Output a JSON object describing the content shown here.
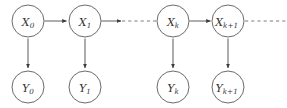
{
  "figure": {
    "title": "",
    "type": "directed-graphical-model",
    "background_color": "#ffffff",
    "node_stroke_color": "#5a5a5a",
    "edge_color": "#4a4a4a",
    "dashed_edge_color": "#6e6e6e",
    "label_color": "#333333"
  },
  "chart_data": {
    "type": "diagram",
    "title": "",
    "nodes": [
      {
        "id": "X0",
        "base": "X",
        "sub": "0",
        "label": "X0",
        "row": "hidden",
        "cx": 28,
        "cy": 21,
        "r": 16
      },
      {
        "id": "X1",
        "base": "X",
        "sub": "1",
        "label": "X1",
        "row": "hidden",
        "cx": 85,
        "cy": 21,
        "r": 16
      },
      {
        "id": "Xk",
        "base": "X",
        "sub": "k",
        "label": "Xk",
        "row": "hidden",
        "cx": 173,
        "cy": 21,
        "r": 16
      },
      {
        "id": "Xk1",
        "base": "X",
        "sub": "k+1",
        "label": "Xk+1",
        "row": "hidden",
        "cx": 228,
        "cy": 21,
        "r": 16
      },
      {
        "id": "Y0",
        "base": "Y",
        "sub": "0",
        "label": "Y0",
        "row": "observed",
        "cx": 28,
        "cy": 87,
        "r": 16
      },
      {
        "id": "Y1",
        "base": "Y",
        "sub": "1",
        "label": "Y1",
        "row": "observed",
        "cx": 85,
        "cy": 87,
        "r": 16
      },
      {
        "id": "Yk",
        "base": "Y",
        "sub": "k",
        "label": "Yk",
        "row": "observed",
        "cx": 173,
        "cy": 87,
        "r": 16
      },
      {
        "id": "Yk1",
        "base": "Y",
        "sub": "k+1",
        "label": "Yk+1",
        "row": "observed",
        "cx": 228,
        "cy": 87,
        "r": 16
      }
    ],
    "edges": [
      {
        "from": "X0",
        "to": "X1",
        "style": "solid",
        "arrow": true,
        "direction": "horizontal"
      },
      {
        "from": "X1",
        "to": "gap",
        "style": "solid",
        "arrow": true,
        "direction": "horizontal"
      },
      {
        "from": "gap",
        "to": "Xk",
        "style": "dashed",
        "arrow": false,
        "direction": "horizontal"
      },
      {
        "from": "Xk",
        "to": "Xk1",
        "style": "solid",
        "arrow": true,
        "direction": "horizontal"
      },
      {
        "from": "Xk1",
        "to": "edge",
        "style": "dashed",
        "arrow": false,
        "direction": "horizontal"
      },
      {
        "from": "X0",
        "to": "Y0",
        "style": "solid",
        "arrow": true,
        "direction": "vertical"
      },
      {
        "from": "X1",
        "to": "Y1",
        "style": "solid",
        "arrow": true,
        "direction": "vertical"
      },
      {
        "from": "Xk",
        "to": "Yk",
        "style": "solid",
        "arrow": true,
        "direction": "vertical"
      },
      {
        "from": "Xk1",
        "to": "Yk1",
        "style": "solid",
        "arrow": true,
        "direction": "vertical"
      }
    ],
    "xlabel": "",
    "ylabel": "",
    "legend": []
  }
}
